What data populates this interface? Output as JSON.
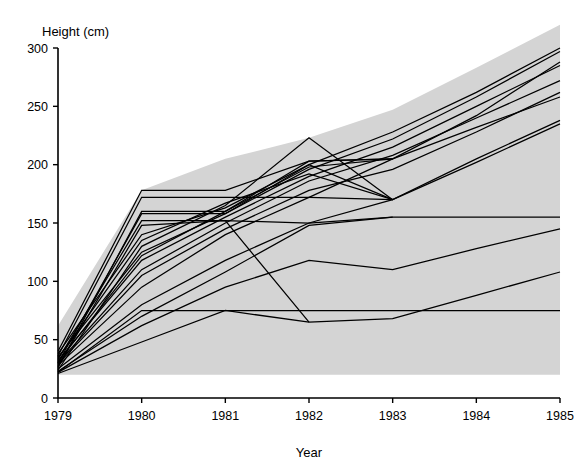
{
  "chart_data": {
    "type": "line",
    "title": "",
    "xlabel": "Year",
    "ylabel": "Height (cm)",
    "x": [
      1979,
      1980,
      1981,
      1982,
      1983,
      1984,
      1985
    ],
    "xticklabels": [
      "1979",
      "1980",
      "1981",
      "1982",
      "1983",
      "1984",
      "1985"
    ],
    "yticklabels": [
      "0",
      "50",
      "100",
      "150",
      "200",
      "250",
      "300"
    ],
    "yticks": [
      0,
      50,
      100,
      150,
      200,
      250,
      300
    ],
    "xlim": [
      1979,
      1985
    ],
    "ylim": [
      0,
      300
    ],
    "grid": false,
    "legend": false,
    "legend_position": "none",
    "line_color": "#000000",
    "band_color": "#d4d4d4",
    "background_color": "#ffffff",
    "annotation": "Shaded grey band spans the region between the lowest and highest tree heights each year; individual black lines are per-tree growth trajectories, several of which end before 1985.",
    "band": {
      "name": "height-range-envelope",
      "upper": [
        62,
        178,
        205,
        223,
        247,
        283,
        320
      ],
      "lower": [
        20,
        20,
        20,
        20,
        20,
        20,
        20
      ]
    },
    "series": [
      {
        "name": "tree-01",
        "x": [
          1979,
          1980,
          1981,
          1982,
          1983,
          1984,
          1985
        ],
        "values": [
          22,
          75,
          75,
          75,
          75,
          75,
          75
        ]
      },
      {
        "name": "tree-02",
        "x": [
          1979,
          1980,
          1981,
          1982,
          1983,
          1984,
          1985
        ],
        "values": [
          22,
          62,
          95,
          118,
          110,
          128,
          145
        ]
      },
      {
        "name": "tree-03",
        "x": [
          1979,
          1980,
          1981,
          1982,
          1983,
          1984,
          1985
        ],
        "values": [
          25,
          80,
          118,
          150,
          170,
          202,
          235
        ]
      },
      {
        "name": "tree-04",
        "x": [
          1979,
          1980,
          1981,
          1982,
          1983,
          1984,
          1985
        ],
        "values": [
          28,
          95,
          140,
          172,
          205,
          232,
          258
        ]
      },
      {
        "name": "tree-05",
        "x": [
          1979,
          1980,
          1981,
          1982,
          1983,
          1984,
          1985
        ],
        "values": [
          30,
          110,
          150,
          186,
          208,
          240,
          272
        ]
      },
      {
        "name": "tree-06",
        "x": [
          1979,
          1980,
          1981,
          1982,
          1983,
          1984,
          1985
        ],
        "values": [
          32,
          118,
          155,
          190,
          215,
          250,
          285
        ]
      },
      {
        "name": "tree-07",
        "x": [
          1979,
          1980,
          1981,
          1982,
          1983,
          1984,
          1985
        ],
        "values": [
          35,
          125,
          158,
          196,
          222,
          258,
          297
        ]
      },
      {
        "name": "tree-08",
        "x": [
          1979,
          1980,
          1981,
          1982,
          1983,
          1984,
          1985
        ],
        "values": [
          38,
          140,
          163,
          200,
          228,
          262,
          300
        ]
      },
      {
        "name": "tree-09",
        "x": [
          1979,
          1980,
          1981,
          1982,
          1983
        ],
        "values": [
          26,
          160,
          160,
          198,
          205
        ]
      },
      {
        "name": "tree-10",
        "x": [
          1979,
          1980,
          1981,
          1982,
          1983
        ],
        "values": [
          30,
          158,
          158,
          200,
          170
        ]
      },
      {
        "name": "tree-11",
        "x": [
          1979,
          1980,
          1981,
          1982,
          1983
        ],
        "values": [
          24,
          130,
          165,
          223,
          170
        ]
      },
      {
        "name": "tree-12",
        "x": [
          1979,
          1980,
          1981,
          1982,
          1983
        ],
        "values": [
          36,
          172,
          172,
          172,
          170
        ]
      },
      {
        "name": "tree-13",
        "x": [
          1979,
          1980,
          1981,
          1982,
          1983
        ],
        "values": [
          40,
          178,
          178,
          203,
          205
        ]
      },
      {
        "name": "tree-14",
        "x": [
          1979,
          1980,
          1981,
          1982,
          1983
        ],
        "values": [
          27,
          148,
          152,
          150,
          155
        ]
      },
      {
        "name": "tree-15",
        "x": [
          1979,
          1980,
          1981,
          1982
        ],
        "values": [
          33,
          152,
          152,
          65
        ]
      },
      {
        "name": "tree-16",
        "x": [
          1979,
          1980,
          1981,
          1982,
          1983,
          1984,
          1985
        ],
        "values": [
          21,
          48,
          75,
          65,
          68,
          88,
          108
        ]
      },
      {
        "name": "tree-17",
        "x": [
          1979,
          1980,
          1981,
          1982,
          1983,
          1984,
          1985
        ],
        "values": [
          23,
          70,
          108,
          148,
          155,
          155,
          155
        ]
      },
      {
        "name": "tree-18",
        "x": [
          1979,
          1980,
          1981,
          1982,
          1983,
          1984,
          1985
        ],
        "values": [
          29,
          105,
          145,
          178,
          196,
          228,
          262
        ]
      },
      {
        "name": "tree-19",
        "x": [
          1979,
          1980,
          1981,
          1982,
          1983,
          1984,
          1985
        ],
        "values": [
          34,
          135,
          167,
          192,
          170,
          205,
          238
        ]
      },
      {
        "name": "tree-20",
        "x": [
          1979,
          1980,
          1981,
          1982,
          1983,
          1984,
          1985
        ],
        "values": [
          31,
          122,
          160,
          203,
          205,
          242,
          288
        ]
      }
    ]
  }
}
